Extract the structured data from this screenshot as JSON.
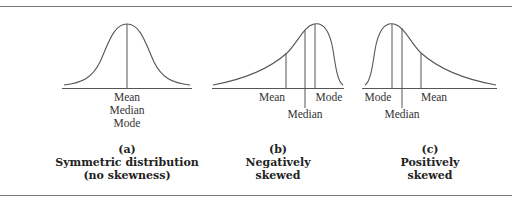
{
  "figure": {
    "panels": [
      {
        "id": "a",
        "caption_letter": "(a)",
        "caption_line1": "Symmetric distribution",
        "caption_line2": "(no skewness)",
        "labels": {
          "line1": "Mean",
          "line2": "Median",
          "line3": "Mode"
        }
      },
      {
        "id": "b",
        "caption_letter": "(b)",
        "caption_line1": "Negatively",
        "caption_line2": "skewed",
        "labels": {
          "mean": "Mean",
          "median": "Median",
          "mode": "Mode"
        }
      },
      {
        "id": "c",
        "caption_letter": "(c)",
        "caption_line1": "Positively",
        "caption_line2": "skewed",
        "labels": {
          "mode": "Mode",
          "median": "Median",
          "mean": "Mean"
        }
      }
    ],
    "colors": {
      "stroke": "#555555",
      "rule": "#777777",
      "text": "#222222"
    }
  }
}
